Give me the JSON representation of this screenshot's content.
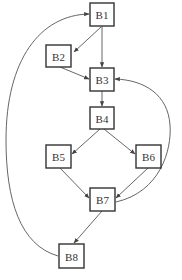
{
  "diagram": {
    "type": "control-flow-graph",
    "colors": {
      "stroke": "#333333",
      "edge": "#555555",
      "background": "#ffffff"
    },
    "nodes": [
      {
        "id": "B1",
        "label": "B1",
        "x": 90,
        "y": 3,
        "w": 24,
        "h": 23
      },
      {
        "id": "B2",
        "label": "B2",
        "x": 46,
        "y": 45,
        "w": 25,
        "h": 22
      },
      {
        "id": "B3",
        "label": "B3",
        "x": 90,
        "y": 68,
        "w": 24,
        "h": 23
      },
      {
        "id": "B4",
        "label": "B4",
        "x": 90,
        "y": 107,
        "w": 24,
        "h": 22
      },
      {
        "id": "B5",
        "label": "B5",
        "x": 46,
        "y": 145,
        "w": 25,
        "h": 23
      },
      {
        "id": "B6",
        "label": "B6",
        "x": 136,
        "y": 145,
        "w": 25,
        "h": 23
      },
      {
        "id": "B7",
        "label": "B7",
        "x": 90,
        "y": 188,
        "w": 25,
        "h": 23
      },
      {
        "id": "B8",
        "label": "B8",
        "x": 59,
        "y": 244,
        "w": 25,
        "h": 24
      }
    ],
    "edges": [
      {
        "from": "B1",
        "to": "B2"
      },
      {
        "from": "B1",
        "to": "B3"
      },
      {
        "from": "B2",
        "to": "B3"
      },
      {
        "from": "B3",
        "to": "B4"
      },
      {
        "from": "B4",
        "to": "B5"
      },
      {
        "from": "B4",
        "to": "B6"
      },
      {
        "from": "B5",
        "to": "B7"
      },
      {
        "from": "B6",
        "to": "B7"
      },
      {
        "from": "B7",
        "to": "B3",
        "kind": "back-edge"
      },
      {
        "from": "B7",
        "to": "B8"
      },
      {
        "from": "B8",
        "to": "B1",
        "kind": "back-edge"
      }
    ]
  }
}
